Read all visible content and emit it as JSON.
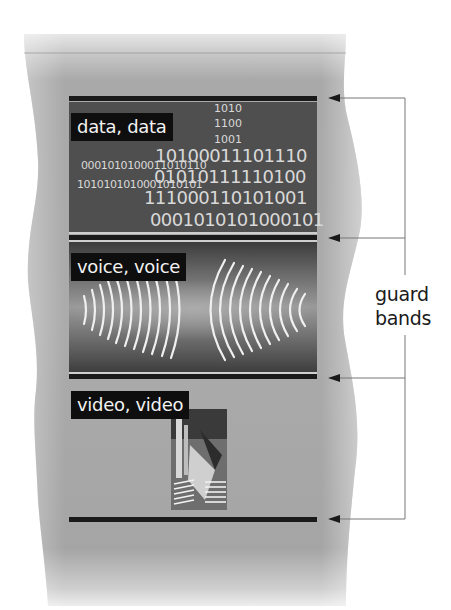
{
  "diagram": {
    "bands": [
      {
        "id": "data",
        "label": "data, data"
      },
      {
        "id": "voice",
        "label": "voice, voice"
      },
      {
        "id": "video",
        "label": "video, video"
      }
    ],
    "binary_stream": {
      "small": [
        "1010",
        "1100",
        "1001"
      ],
      "medium": [
        "0001010100011010110",
        "1010101010001010101"
      ],
      "large": [
        "10100011101110",
        "01010111110100",
        "111000110101001",
        "0001010101000101"
      ]
    },
    "annotation": {
      "line1": "guard",
      "line2": "bands",
      "arrow_count": 4
    },
    "colors": {
      "medium": "#a8a8a8",
      "band_fill": "#555555",
      "guard_band": "#1a1a1a",
      "label_bg": "#0e0e0e",
      "text_light": "#f2f2f2",
      "annotation_line": "#777777"
    }
  }
}
